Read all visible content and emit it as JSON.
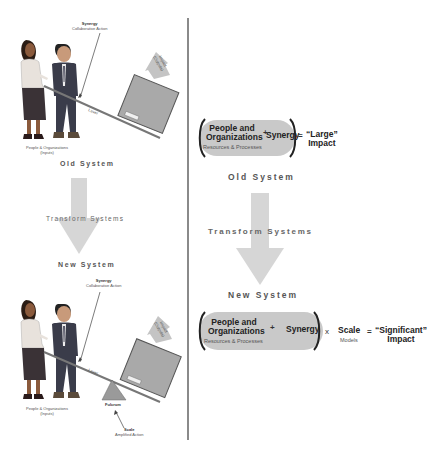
{
  "left_panel": {
    "top_illustration": {
      "synergy_label": "Synergy",
      "synergy_sub": "Collaborative Action",
      "impact_label": "Impact",
      "impact_sub": "(Outputs)",
      "lever_label": "Lever",
      "people_label": "People & Organizations",
      "people_sub": "(Inputs)"
    },
    "old_system_label": "Old System",
    "transform_label": "Transform Systems",
    "new_system_label": "New System",
    "bottom_illustration": {
      "synergy_label": "Synergy",
      "synergy_sub": "Collaborative Action",
      "impact_label": "Impact",
      "impact_sub": "(Outputs)",
      "lever_label": "Lever",
      "people_label": "People & Organizations",
      "people_sub": "(Inputs)",
      "fulcrum_label": "Fulcrum",
      "scale_label": "Scale",
      "scale_sub": "Amplified Action"
    }
  },
  "right_panel": {
    "old_equation": {
      "term1_line1": "People and",
      "term1_line2": "Organizations",
      "term1_sub": "Resources & Processes",
      "op1": "+",
      "term2": "Synergy",
      "equals": "=",
      "result_line1": "“Large”",
      "result_line2": "Impact"
    },
    "old_system_label": "Old System",
    "transform_label": "Transform Systems",
    "new_system_label": "New System",
    "new_equation": {
      "term1_line1": "People and",
      "term1_line2": "Organizations",
      "term1_sub": "Resources & Processes",
      "op1": "+",
      "term2": "Synergy",
      "op2": "x",
      "term3": "Scale",
      "term3_sub": "Models",
      "equals": "=",
      "result_line1": "“Significant”",
      "result_line2": "Impact"
    }
  },
  "colors": {
    "arrow": "#d6d6d6",
    "pill": "#c9c9c9",
    "box": "#a9a9a9",
    "divider": "#8a8a8a",
    "text_dark": "#222222"
  }
}
